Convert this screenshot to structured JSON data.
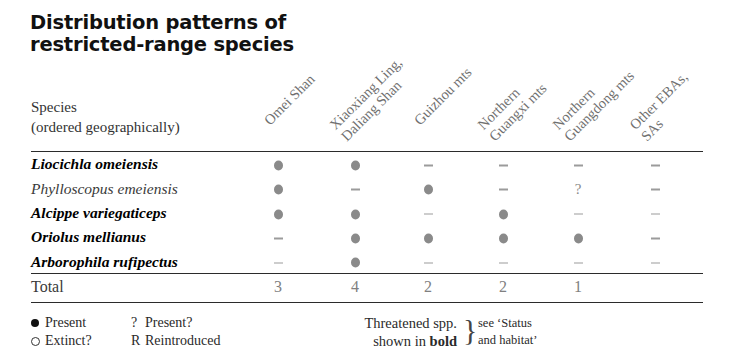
{
  "title": {
    "line1": "Distribution patterns of",
    "line2": "restricted-range species"
  },
  "species_header": {
    "line1": "Species",
    "line2": "(ordered geographically)"
  },
  "columns": [
    {
      "id": "omei-shan",
      "line1": "Omei Shan",
      "line2": ""
    },
    {
      "id": "xiaoxiang-daliang",
      "line1": "Xiaoxiang Ling,",
      "line2": "Daliang Shan"
    },
    {
      "id": "guizhou-mts",
      "line1": "Guizhou mts",
      "line2": ""
    },
    {
      "id": "northern-guangxi",
      "line1": "Northern",
      "line2": "Guangxi mts"
    },
    {
      "id": "northern-guangdong",
      "line1": "Northern",
      "line2": "Guangdong mts"
    },
    {
      "id": "other-ebas-sas",
      "line1": "Other EBAs,",
      "line2": "SAs"
    }
  ],
  "rows": [
    {
      "species": "Liocichla omeiensis",
      "bold": true,
      "cells": [
        "present",
        "present",
        "absent",
        "absent",
        "absent",
        "absent"
      ]
    },
    {
      "species": "Phylloscopus emeiensis",
      "bold": false,
      "cells": [
        "present",
        "absent",
        "present",
        "absent",
        "query",
        "absent"
      ]
    },
    {
      "species": "Alcippe variegaticeps",
      "bold": true,
      "cells": [
        "present",
        "present",
        "absent",
        "present",
        "absent",
        "absent"
      ]
    },
    {
      "species": "Oriolus mellianus",
      "bold": true,
      "cells": [
        "absent",
        "present",
        "present",
        "present",
        "present",
        "absent"
      ]
    },
    {
      "species": "Arborophila rufipectus",
      "bold": true,
      "cells": [
        "absent",
        "present",
        "absent",
        "absent",
        "absent",
        "absent"
      ]
    }
  ],
  "total": {
    "label": "Total",
    "values": [
      "3",
      "4",
      "2",
      "2",
      "1",
      ""
    ]
  },
  "legend": {
    "present_symbol": "filled-circle",
    "present_label": "Present",
    "extinct_symbol": "open-circle",
    "extinct_label": "Extinct?",
    "query_symbol": "?",
    "query_label": "Present?",
    "reintroduced_symbol": "R",
    "reintroduced_label": "Reintroduced",
    "threatened_line1": "Threatened spp.",
    "threatened_line2_prefix": "shown in ",
    "threatened_line2_bold": "bold",
    "status_line1": "see ‘Status",
    "status_line2": "and habitat’"
  },
  "colors": {
    "rule": "#2b2b2b",
    "marker": "#8a8a8a",
    "header_text": "#6f6f6f",
    "body_text": "#151515"
  }
}
